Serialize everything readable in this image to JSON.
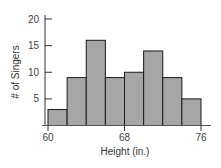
{
  "chart_data": {
    "type": "bar",
    "subtype": "histogram",
    "title": "",
    "xlabel": "Height (in.)",
    "ylabel": "# of Singers",
    "bin_edges": [
      60,
      62,
      64,
      66,
      68,
      70,
      72,
      74,
      76
    ],
    "categories": [
      "60-62",
      "62-64",
      "64-66",
      "66-68",
      "68-70",
      "70-72",
      "72-74",
      "74-76"
    ],
    "values": [
      3,
      9,
      16,
      9,
      10,
      14,
      9,
      5
    ],
    "xlim": [
      60,
      76
    ],
    "ylim": [
      0,
      20
    ],
    "x_ticks": [
      60,
      68,
      76
    ],
    "y_ticks": [
      5,
      10,
      15,
      20
    ],
    "grid": false,
    "legend": null,
    "colors": {
      "bar_fill": "#a6a6a6",
      "bar_edge": "#1a1a1a",
      "axis": "#333333"
    }
  },
  "labels": {
    "xlabel": "Height (in.)",
    "ylabel": "# of Singers",
    "xticks": [
      "60",
      "68",
      "76"
    ],
    "yticks": [
      "5",
      "10",
      "15",
      "20"
    ]
  }
}
